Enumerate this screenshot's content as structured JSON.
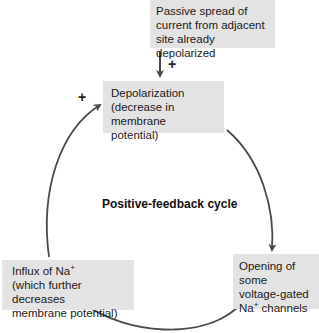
{
  "diagram": {
    "title": "Positive-feedback cycle",
    "nodes": {
      "top": {
        "lines": [
          "Passive spread of",
          "current from adjacent",
          "site already depolarized"
        ]
      },
      "depolarization": {
        "lines": [
          "Depolarization",
          "(decrease in",
          "membrane potential)"
        ]
      },
      "opening": {
        "line1": "Opening of some",
        "line2": "voltage-gated",
        "line3_prefix": "Na",
        "line3_sup": "+",
        "line3_suffix": " channels"
      },
      "influx": {
        "line1_prefix": "Influx of Na",
        "line1_sup": "+",
        "line2": "(which further decreases",
        "line3": "membrane potential)"
      }
    },
    "signs": {
      "top_arrow": "+",
      "left_arrow": "+"
    },
    "colors": {
      "box_fill": "#e3e3e3",
      "arrow": "#4a4a4a",
      "text": "#1a1a1a"
    },
    "edges": [
      {
        "from": "top",
        "to": "depolarization",
        "sign": "+"
      },
      {
        "from": "depolarization",
        "to": "opening"
      },
      {
        "from": "opening",
        "to": "influx"
      },
      {
        "from": "influx",
        "to": "depolarization",
        "sign": "+"
      }
    ]
  }
}
